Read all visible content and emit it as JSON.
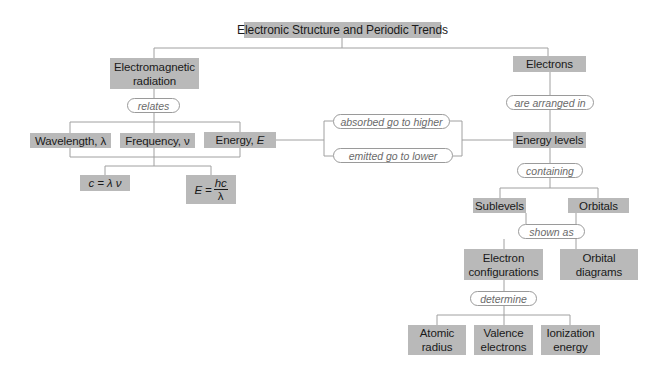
{
  "title": "Electronic Structure and Periodic Trends",
  "nodes": {
    "em_radiation": "Electromagnetic radiation",
    "electrons": "Electrons",
    "wavelength": "Wavelength, λ",
    "frequency": "Frequency, ν",
    "energy_label": "Energy, ",
    "energy_var": "E",
    "c_eq": "c = λ ν",
    "e_eq_lhs": "E = ",
    "e_eq_num": "hc",
    "e_eq_den": "λ",
    "energy_levels": "Energy levels",
    "sublevels": "Sublevels",
    "orbitals": "Orbitals",
    "electron_configurations": "Electron configurations",
    "orbital_diagrams": "Orbital diagrams",
    "atomic_radius": "Atomic radius",
    "valence_electrons": "Valence electrons",
    "ionization_energy": "Ionization energy"
  },
  "links": {
    "relates": "relates",
    "absorbed": "absorbed go to higher",
    "emitted": "emitted go to lower",
    "arranged": "are arranged in",
    "containing": "containing",
    "shown_as": "shown as",
    "determine": "determine"
  },
  "colors": {
    "box": "#b9b9b9",
    "line": "#9a9a9a",
    "link_text": "#6a6a6a"
  }
}
